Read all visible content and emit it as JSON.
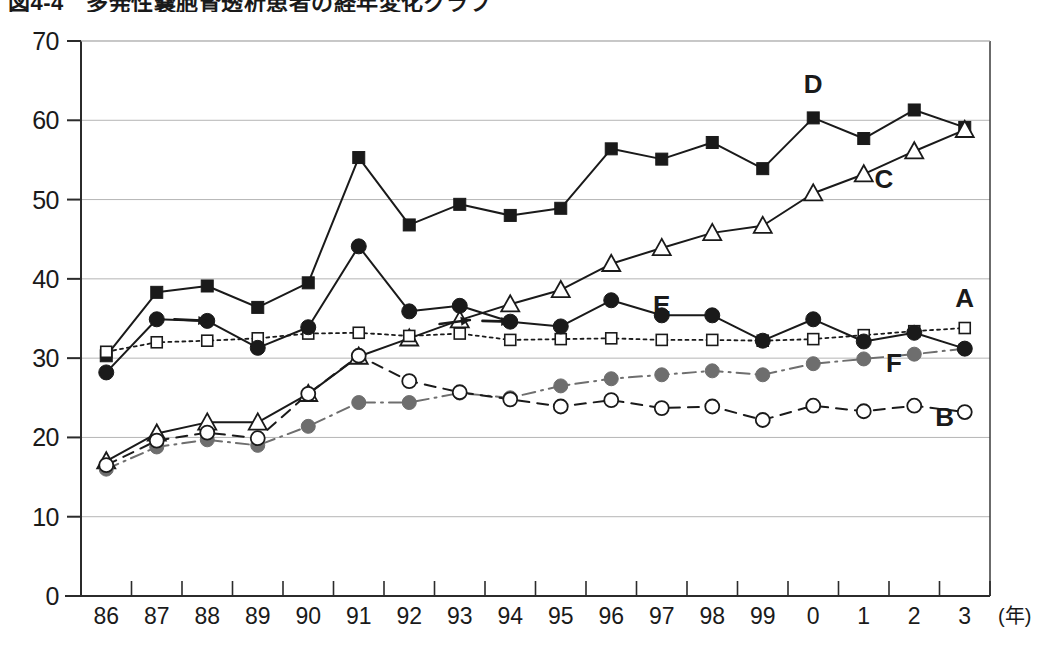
{
  "title": "図4-4　多発性嚢胞腎透析患者の経年変化グラフ",
  "caption": "",
  "axes": {
    "y_ticks": [
      0,
      10,
      20,
      30,
      40,
      50,
      60,
      70
    ],
    "y_min": 0,
    "y_max": 70,
    "x_unit_label": "(年)",
    "x_tick_labels": [
      "86",
      "87",
      "88",
      "89",
      "90",
      "91",
      "92",
      "93",
      "94",
      "95",
      "96",
      "97",
      "98",
      "99",
      "0",
      "1",
      "2",
      "3"
    ]
  },
  "colors": {
    "axis": "#2b2b2b",
    "grid": "#b5b5b5",
    "series_dark": "#1a1a1a",
    "series_gray": "#6e6e6e",
    "frame": "#3a3a3a",
    "text": "#1a1a1a"
  },
  "series_labels": {
    "A": "A",
    "B": "B",
    "C": "C",
    "D": "D",
    "E": "E",
    "F": "F"
  },
  "chart_data": {
    "type": "line",
    "title": "図4-4　多発性嚢胞腎透析患者の経年変化グラフ",
    "xlabel": "(年)",
    "ylabel": "",
    "ylim": [
      0,
      70
    ],
    "grid": true,
    "legend": "inline-labels",
    "categories": [
      "86",
      "87",
      "88",
      "89",
      "90",
      "91",
      "92",
      "93",
      "94",
      "95",
      "96",
      "97",
      "98",
      "99",
      "0",
      "1",
      "2",
      "3"
    ],
    "series": [
      {
        "name": "D",
        "marker": "filled-square",
        "line": "solid",
        "color": "#1a1a1a",
        "label_x": 14,
        "label_y": 63.5,
        "values": [
          30.3,
          38.3,
          39.1,
          36.4,
          39.5,
          55.3,
          46.8,
          49.4,
          48.0,
          48.9,
          56.4,
          55.1,
          57.2,
          53.9,
          60.3,
          57.7,
          61.3,
          59.1
        ]
      },
      {
        "name": "C",
        "marker": "open-triangle",
        "line": "solid",
        "color": "#1a1a1a",
        "label_x": 15.4,
        "label_y": 51.5,
        "values": [
          17.0,
          20.5,
          21.9,
          21.9,
          25.5,
          30.2,
          32.5,
          34.8,
          36.8,
          38.6,
          41.9,
          43.9,
          45.8,
          46.7,
          50.8,
          53.2,
          56.1,
          58.8
        ]
      },
      {
        "name": "E",
        "marker": "filled-circle",
        "line": "solid",
        "color": "#1a1a1a",
        "label_x": 11.0,
        "label_y": 35.6,
        "values": [
          28.2,
          34.9,
          34.7,
          31.3,
          33.9,
          44.1,
          35.9,
          36.6,
          34.6,
          34.0,
          37.3,
          35.4,
          35.4,
          32.2,
          34.9,
          32.1,
          33.2,
          31.2
        ]
      },
      {
        "name": "A",
        "marker": "open-square",
        "line": "dotted",
        "color": "#1a1a1a",
        "label_x": 17.0,
        "label_y": 36.5,
        "values": [
          30.8,
          32.0,
          32.2,
          32.5,
          33.1,
          33.2,
          32.8,
          33.1,
          32.3,
          32.4,
          32.5,
          32.3,
          32.3,
          32.2,
          32.4,
          32.9,
          33.4,
          33.8
        ]
      },
      {
        "name": "F",
        "marker": "gray-circle",
        "line": "dashdot",
        "color": "#6e6e6e",
        "label_x": 15.6,
        "label_y": 28.3,
        "values": [
          16.0,
          18.8,
          19.7,
          19.0,
          21.4,
          24.4,
          24.4,
          25.6,
          25.0,
          26.5,
          27.4,
          27.9,
          28.4,
          27.9,
          29.3,
          29.9,
          30.5,
          31.2
        ]
      },
      {
        "name": "B",
        "marker": "open-circle",
        "line": "dashed",
        "color": "#1a1a1a",
        "label_x": 16.6,
        "label_y": 21.5,
        "values": [
          16.5,
          19.6,
          20.6,
          19.9,
          25.5,
          30.3,
          27.1,
          25.7,
          24.8,
          23.9,
          24.7,
          23.7,
          23.9,
          22.2,
          24.0,
          23.3,
          24.0,
          23.2
        ]
      }
    ],
    "annotations": [
      {
        "name": "arrow-88-e",
        "x0": 1.35,
        "y0": 34.9,
        "x1": 2.0,
        "y1": 34.7
      },
      {
        "name": "arrow-93-c",
        "x0": 6.6,
        "y0": 34.3,
        "x1": 7.2,
        "y1": 34.8
      },
      {
        "name": "arrow-94-e",
        "x0": 7.45,
        "y0": 34.7,
        "x1": 8.0,
        "y1": 34.6
      }
    ]
  }
}
